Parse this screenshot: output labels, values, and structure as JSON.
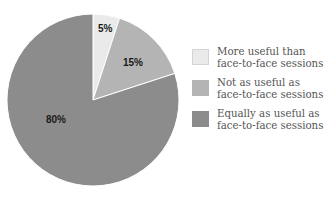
{
  "chart_data": {
    "type": "pie",
    "title": "",
    "categories": [
      "More useful than face-to-face sessions",
      "Not as useful as face-to-face sessions",
      "Equally as useful as face-to-face sessions"
    ],
    "values": [
      5,
      15,
      80
    ],
    "labels": [
      "5%",
      "15%",
      "80%"
    ],
    "colors": [
      "#eaeaea",
      "#b4b4b4",
      "#8c8c8c"
    ],
    "start_angle": "12 o'clock, clockwise",
    "legend_position": "right"
  },
  "legend": [
    {
      "line1": "More useful than",
      "line2": "face-to-face sessions",
      "color": "#eaeaea"
    },
    {
      "line1": "Not as useful as",
      "line2": "face-to-face sessions",
      "color": "#b4b4b4"
    },
    {
      "line1": "Equally as useful as",
      "line2": "face-to-face sessions",
      "color": "#8c8c8c"
    }
  ]
}
